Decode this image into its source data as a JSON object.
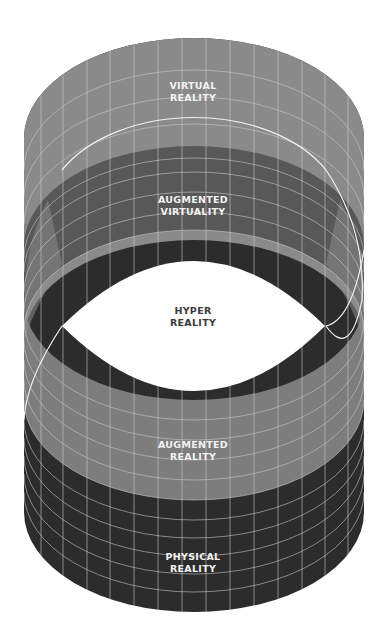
{
  "diagram": {
    "colors": {
      "background": "#ffffff",
      "virtual_reality": "#8a8a8a",
      "augmented_virtuality": "#585858",
      "hyper_reality": "#ffffff",
      "augmented_reality": "#7d7d7d",
      "physical_reality": "#2c2c2c",
      "grid": "#c8c8c8",
      "edge_highlight": "#f0f0f0"
    },
    "layers": [
      {
        "id": "virtual-reality",
        "line1": "Virtual",
        "line2": "Reality"
      },
      {
        "id": "augmented-virtuality",
        "line1": "Augmented",
        "line2": "Virtuality"
      },
      {
        "id": "hyper-reality",
        "line1": "Hyper",
        "line2": "Reality"
      },
      {
        "id": "augmented-reality",
        "line1": "Augmented",
        "line2": "Reality"
      },
      {
        "id": "physical-reality",
        "line1": "Physical",
        "line2": "Reality"
      }
    ]
  }
}
